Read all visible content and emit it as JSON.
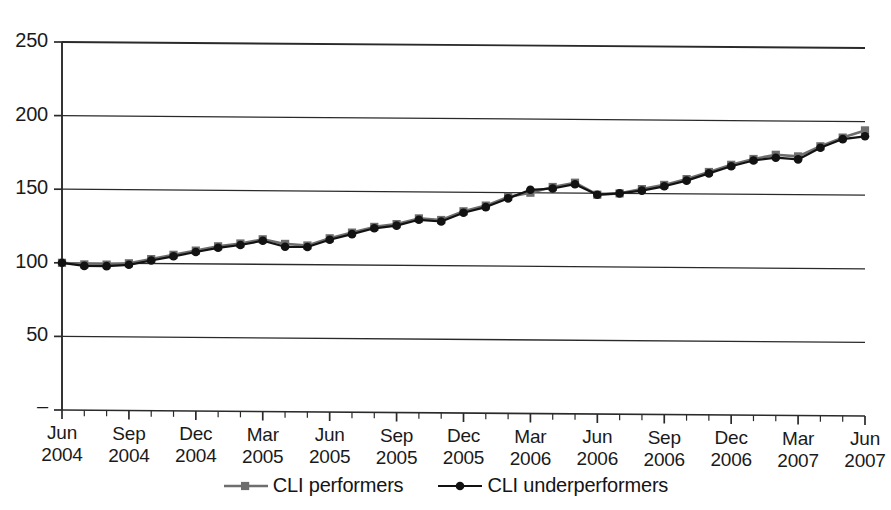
{
  "chart_data": {
    "type": "line",
    "title": "",
    "xlabel": "",
    "ylabel": "",
    "ylim": [
      0,
      250
    ],
    "yticks": [
      0,
      50,
      100,
      150,
      200,
      250
    ],
    "ytick_labels": [
      "–",
      "50",
      "100",
      "150",
      "200",
      "250"
    ],
    "grid": true,
    "legend_position": "bottom-center",
    "x_major_labels": [
      {
        "month": "Jun",
        "year": "2004"
      },
      {
        "month": "Sep",
        "year": "2004"
      },
      {
        "month": "Dec",
        "year": "2004"
      },
      {
        "month": "Mar",
        "year": "2005"
      },
      {
        "month": "Jun",
        "year": "2005"
      },
      {
        "month": "Sep",
        "year": "2005"
      },
      {
        "month": "Dec",
        "year": "2005"
      },
      {
        "month": "Mar",
        "year": "2006"
      },
      {
        "month": "Jun",
        "year": "2006"
      },
      {
        "month": "Sep",
        "year": "2006"
      },
      {
        "month": "Dec",
        "year": "2006"
      },
      {
        "month": "Mar",
        "year": "2007"
      },
      {
        "month": "Jun",
        "year": "2007"
      }
    ],
    "x": [
      "Jun 2004",
      "Jul 2004",
      "Aug 2004",
      "Sep 2004",
      "Oct 2004",
      "Nov 2004",
      "Dec 2004",
      "Jan 2005",
      "Feb 2005",
      "Mar 2005",
      "Apr 2005",
      "May 2005",
      "Jun 2005",
      "Jul 2005",
      "Aug 2005",
      "Sep 2005",
      "Oct 2005",
      "Nov 2005",
      "Dec 2005",
      "Jan 2006",
      "Feb 2006",
      "Mar 2006",
      "Apr 2006",
      "May 2006",
      "Jun 2006",
      "Jul 2006",
      "Aug 2006",
      "Sep 2006",
      "Oct 2006",
      "Nov 2006",
      "Dec 2006",
      "Jan 2007",
      "Feb 2007",
      "Mar 2007",
      "Apr 2007",
      "May 2007",
      "Jun 2007"
    ],
    "series": [
      {
        "name": "CLI performers",
        "color": "#6e6e6e",
        "marker": "square",
        "values": [
          100,
          99,
          99,
          100,
          103,
          106,
          109,
          112,
          114,
          117,
          114,
          113,
          118,
          122,
          126,
          128,
          132,
          131,
          137,
          141,
          147,
          150,
          154,
          157,
          149,
          150,
          153,
          156,
          160,
          165,
          170,
          174,
          177,
          176,
          183,
          189,
          194
        ]
      },
      {
        "name": "CLI underperformers",
        "color": "#121212",
        "marker": "circle",
        "values": [
          100,
          98,
          98,
          99,
          102,
          105,
          108,
          111,
          113,
          116,
          112,
          112,
          117,
          121,
          125,
          127,
          131,
          130,
          136,
          140,
          146,
          152,
          153,
          156,
          149,
          150,
          152,
          155,
          159,
          164,
          169,
          173,
          175,
          174,
          182,
          188,
          190
        ]
      }
    ]
  },
  "legend": {
    "items": [
      {
        "label": "CLI performers"
      },
      {
        "label": "CLI underperformers"
      }
    ]
  }
}
